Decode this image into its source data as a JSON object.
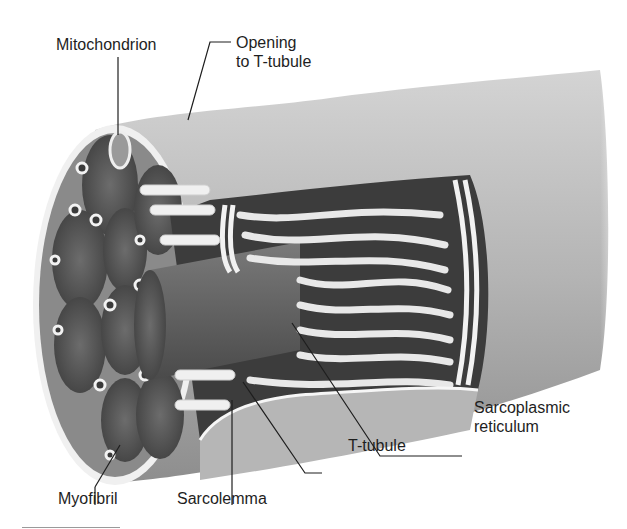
{
  "figure": {
    "labels": {
      "mitochondrion": "Mitochondrion",
      "opening_line1": "Opening",
      "opening_line2": "to T-tubule",
      "sarcoplasmic_line1": "Sarcoplasmic",
      "sarcoplasmic_line2": "reticulum",
      "t_tubule": "T-tubule",
      "myofibril": "Myofibril",
      "sarcolemma": "Sarcolemma"
    },
    "colors": {
      "background": "#ffffff",
      "sarcolemma_surface": "#b9b9b9",
      "myofibril": "#5e5e5e",
      "reticulum": "#e6e6e6",
      "leader_line": "#1e1e1e"
    }
  }
}
